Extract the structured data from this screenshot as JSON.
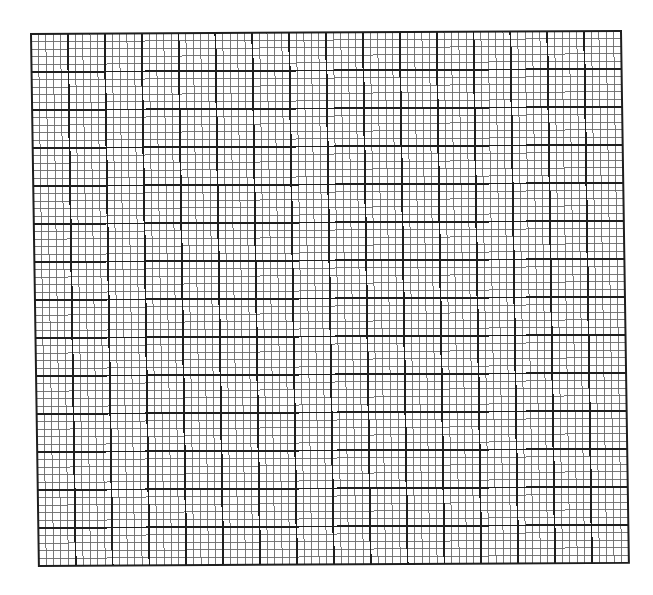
{
  "graph_paper": {
    "major_columns": 16,
    "major_rows": 14,
    "minor_per_major": 5,
    "width_px": 590,
    "height_px": 532,
    "colors": {
      "background": "#ffffff",
      "minor_line": "#6a6a6a",
      "major_line": "#1e1e1e",
      "border": "#1e1e1e"
    },
    "line_widths": {
      "minor": 0.9,
      "major": 1.8,
      "border": 2
    }
  }
}
